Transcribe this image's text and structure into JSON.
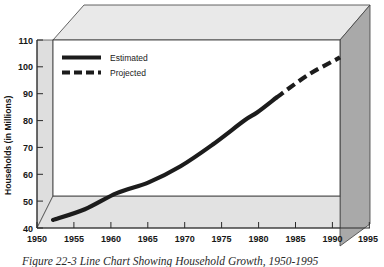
{
  "figure": {
    "caption": "Figure 22-3   Line Chart Showing Household Growth, 1950-1995"
  },
  "colors": {
    "line": "#1c1c1c",
    "plot_background": "#ffffff",
    "floor_panel": "#e2e2e2",
    "left_wall_panel": "#dedede",
    "top_panel": "#e9e9e9",
    "right_wall_panel": "#a9a9a9",
    "frame_stroke": "#3a3a3a",
    "text": "#161616"
  },
  "chart_data": {
    "type": "line",
    "title": "Figure 22-3   Line Chart Showing Household Growth, 1950-1995",
    "xlabel": "",
    "ylabel": "Households (in Millions)",
    "xlim": [
      1950,
      1995
    ],
    "ylim": [
      40,
      110
    ],
    "grid": false,
    "legend_position": "top-left inside plot",
    "xticks": [
      1950,
      1955,
      1960,
      1965,
      1970,
      1975,
      1980,
      1985,
      1990,
      1995
    ],
    "yticks": [
      40,
      50,
      60,
      70,
      80,
      90,
      100,
      110
    ],
    "x": [
      1950,
      1955,
      1960,
      1965,
      1970,
      1975,
      1980,
      1982,
      1985,
      1990,
      1995
    ],
    "series": [
      {
        "name": "Estimated",
        "style": "solid",
        "x": [
          1950,
          1955,
          1960,
          1965,
          1970,
          1975,
          1980,
          1982,
          1985
        ],
        "values": [
          43,
          47,
          53,
          57,
          63,
          71,
          80,
          83,
          88.5
        ]
      },
      {
        "name": "Projected",
        "style": "dashed",
        "x": [
          1985,
          1990,
          1995
        ],
        "values": [
          88.5,
          97,
          103.5
        ]
      }
    ]
  },
  "yaxis": {
    "title": "Households (in Millions)",
    "labels": [
      "110",
      "100",
      "90",
      "80",
      "70",
      "60",
      "50",
      "40"
    ]
  },
  "xaxis": {
    "labels": [
      "1950",
      "1955",
      "1960",
      "1965",
      "1970",
      "1975",
      "1980",
      "1985",
      "1990",
      "1995"
    ]
  },
  "legend": {
    "items": [
      {
        "label": "Estimated",
        "style": "solid"
      },
      {
        "label": "Projected",
        "style": "dashed"
      }
    ]
  }
}
